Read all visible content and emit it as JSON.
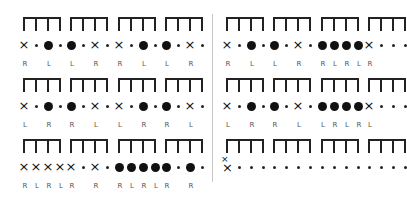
{
  "left_panel": {
    "rows": [
      {
        "notes": [
          "x",
          ".",
          "o",
          ".",
          "o",
          ".",
          "x",
          ".",
          "x",
          ".",
          "o",
          ".",
          "o",
          ".",
          "x",
          "."
        ],
        "labels": [
          "R",
          "",
          "L",
          "",
          "L",
          "",
          "R",
          "",
          "R",
          "",
          "L",
          "",
          "L",
          "",
          "R",
          ""
        ]
      },
      {
        "notes": [
          "x",
          ".",
          "o",
          ".",
          "o",
          ".",
          "x",
          ".",
          "x",
          ".",
          "o",
          ".",
          "o",
          ".",
          "x",
          "."
        ],
        "labels": [
          "L",
          "",
          "R",
          "",
          "R",
          "",
          "L",
          "",
          "L",
          "",
          "R",
          "",
          "R",
          "",
          "L",
          ""
        ]
      },
      {
        "notes": [
          "x",
          "x",
          "x",
          "x",
          "x",
          ".",
          "x",
          ".",
          "o",
          "o",
          "o",
          "o",
          "o",
          ".",
          "o",
          "."
        ],
        "labels": [
          "R",
          "L",
          "R",
          "L",
          "R",
          "",
          "R",
          "",
          "R",
          "L",
          "R",
          "L",
          "R",
          "",
          "R",
          ""
        ]
      }
    ]
  },
  "right_panel": {
    "rows": [
      {
        "notes": [
          "x",
          ".",
          "o",
          ".",
          "o",
          ".",
          "x",
          ".",
          "o",
          "o",
          "o",
          "o",
          "x",
          ".",
          ".",
          "."
        ],
        "labels": [
          "R",
          "",
          "L",
          "",
          "L",
          "",
          "R",
          "",
          "R",
          "L",
          "R",
          "L",
          "R",
          "",
          "",
          ""
        ]
      },
      {
        "notes": [
          "x",
          ".",
          "o",
          ".",
          "o",
          ".",
          "x",
          ".",
          "o",
          "o",
          "o",
          "o",
          "x",
          ".",
          ".",
          "."
        ],
        "labels": [
          "L",
          "",
          "R",
          "",
          "R",
          "",
          "L",
          "",
          "L",
          "R",
          "L",
          "R",
          "L",
          "",
          "",
          ""
        ]
      },
      {
        "notes": [
          "xx",
          ".",
          ".",
          ".",
          ".",
          ".",
          ".",
          ".",
          ".",
          ".",
          ".",
          ".",
          ".",
          ".",
          ".",
          "."
        ],
        "labels": [
          "",
          "",
          "",
          "",
          "",
          "",
          "",
          "",
          "",
          "",
          "",
          "",
          "",
          "",
          "",
          ""
        ]
      }
    ]
  },
  "symbols": {
    "x": "×",
    "x_small": "×",
    "o": "filled-dot",
    ".": "small-dot"
  },
  "colors": {
    "ink": "#111111",
    "label": "#555555",
    "divider": "#c8c8c8",
    "background": "#ffffff"
  }
}
